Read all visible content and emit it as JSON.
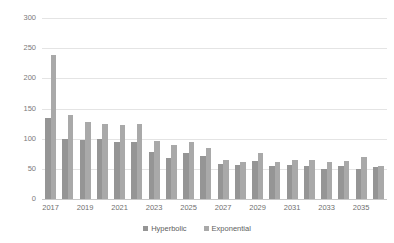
{
  "chart_data": {
    "type": "bar",
    "title": "",
    "xlabel": "",
    "ylabel": "Structures",
    "ylim": [
      0,
      300
    ],
    "yticks": [
      0,
      50,
      100,
      150,
      200,
      250,
      300
    ],
    "grid": true,
    "legend_position": "bottom",
    "categories": [
      "2017",
      "2018",
      "2019",
      "2020",
      "2021",
      "2022",
      "2023",
      "2024",
      "2025",
      "2026",
      "2027",
      "2028",
      "2029",
      "2030",
      "2031",
      "2032",
      "2033",
      "2034",
      "2035",
      "2036"
    ],
    "tick_labels": [
      "2017",
      "",
      "2019",
      "",
      "2021",
      "",
      "2023",
      "",
      "2025",
      "",
      "2027",
      "",
      "2029",
      "",
      "2031",
      "",
      "2033",
      "",
      "2035",
      ""
    ],
    "series": [
      {
        "name": "Hyperbolic",
        "color": "#959595",
        "values": [
          135,
          100,
          97,
          100,
          94,
          95,
          78,
          68,
          76,
          71,
          58,
          57,
          63,
          55,
          57,
          55,
          50,
          55,
          49,
          53
        ]
      },
      {
        "name": "Exponential",
        "color": "#a9a9a9",
        "values": [
          238,
          139,
          128,
          125,
          122,
          125,
          96,
          90,
          95,
          84,
          64,
          61,
          77,
          62,
          65,
          64,
          62,
          63,
          70,
          55
        ]
      }
    ]
  },
  "legend": {
    "items": [
      {
        "label": "Hyperbolic",
        "color": "#959595"
      },
      {
        "label": "Exponential",
        "color": "#a9a9a9"
      }
    ]
  },
  "axis": {
    "y_title": "Structures"
  }
}
